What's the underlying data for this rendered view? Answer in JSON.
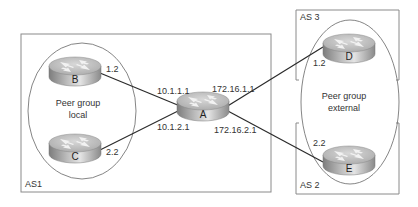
{
  "diagram": {
    "type": "network-topology",
    "autonomous_systems": [
      {
        "id": "as1",
        "label": "AS1"
      },
      {
        "id": "as3",
        "label": "AS 3"
      },
      {
        "id": "as2",
        "label": "AS 2"
      }
    ],
    "peer_groups": [
      {
        "id": "local",
        "line1": "Peer group",
        "line2": "local"
      },
      {
        "id": "external",
        "line1": "Peer group",
        "line2": "external"
      }
    ],
    "routers": [
      {
        "id": "A",
        "label": "A"
      },
      {
        "id": "B",
        "label": "B"
      },
      {
        "id": "C",
        "label": "C"
      },
      {
        "id": "D",
        "label": "D"
      },
      {
        "id": "E",
        "label": "E"
      }
    ],
    "links": [
      {
        "from": "A",
        "to": "B",
        "a_addr": "10.1.1.1",
        "far_addr": "1.2"
      },
      {
        "from": "A",
        "to": "C",
        "a_addr": "10.1.2.1",
        "far_addr": "2.2"
      },
      {
        "from": "A",
        "to": "D",
        "a_addr": "172.16.1.1",
        "far_addr": "1.2"
      },
      {
        "from": "A",
        "to": "E",
        "a_addr": "172.16.2.1",
        "far_addr": "2.2"
      }
    ]
  },
  "colors": {
    "box_stroke": "#8a8a8a",
    "line": "#2a2a2a",
    "router_top": "#c9c9c9",
    "router_side": "#9a9a9a",
    "text": "#333333"
  }
}
